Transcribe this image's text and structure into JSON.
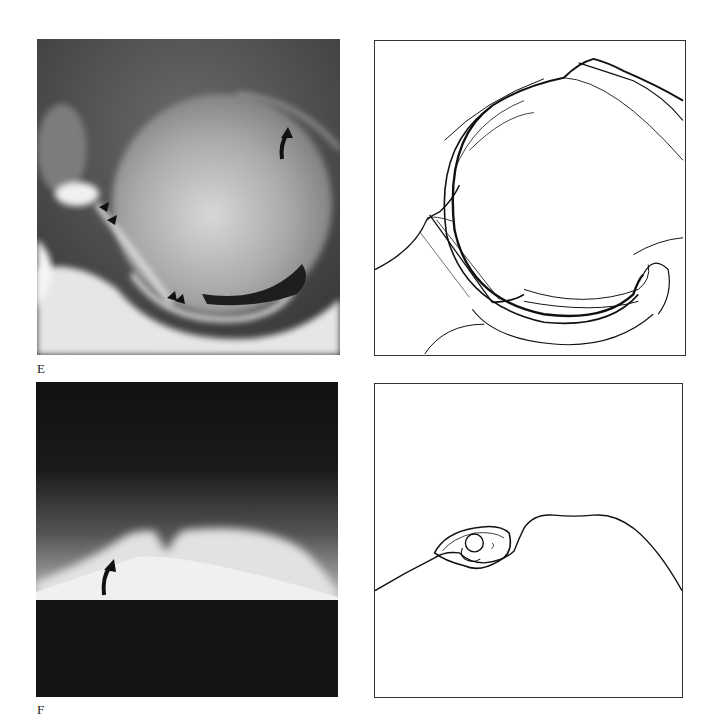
{
  "figure": {
    "panels": [
      {
        "id": "E",
        "label": "E",
        "photo": {
          "type": "radiograph",
          "description": "Contrast arthrogram showing spherical structure with arrowheads and curved arrow annotations",
          "annotations": [
            {
              "type": "curved-arrow",
              "position": "upper-right"
            },
            {
              "type": "arrowhead-pair",
              "position": "left"
            },
            {
              "type": "arrowhead-pair",
              "position": "bottom-center"
            }
          ]
        },
        "drawing": {
          "type": "line-tracing",
          "description": "Line drawing corresponding to radiograph E"
        }
      },
      {
        "id": "F",
        "label": "F",
        "photo": {
          "type": "radiograph",
          "description": "Tangential radiograph showing bright dome-shaped contour with a notch and curved arrow",
          "annotations": [
            {
              "type": "curved-arrow",
              "position": "lower-left"
            }
          ]
        },
        "drawing": {
          "type": "line-tracing",
          "description": "Line drawing corresponding to radiograph F with small oval body at notch"
        }
      }
    ]
  }
}
